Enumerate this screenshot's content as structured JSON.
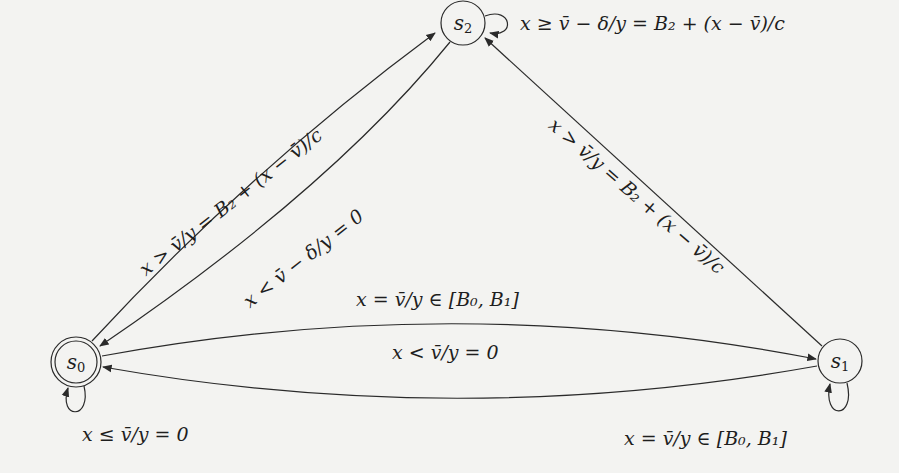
{
  "figure": {
    "type": "state-transition-diagram",
    "states": [
      {
        "id": "s0",
        "label": "s",
        "sub": "0",
        "accepting": true
      },
      {
        "id": "s1",
        "label": "s",
        "sub": "1",
        "accepting": false
      },
      {
        "id": "s2",
        "label": "s",
        "sub": "2",
        "accepting": false
      }
    ],
    "transitions": [
      {
        "from": "s2",
        "to": "s2",
        "label": "x ≥ v̄ − δ/y = B₂ + (x − v̄)/c"
      },
      {
        "from": "s0",
        "to": "s2",
        "label": "x > v̄/y = B₂ + (x − v̄)/c"
      },
      {
        "from": "s2",
        "to": "s0",
        "label": "x < v̄ − δ/y = 0"
      },
      {
        "from": "s1",
        "to": "s2",
        "label": "x > v̄/y = B₂ + (x − v̄)/c"
      },
      {
        "from": "s0",
        "to": "s1",
        "label": "x = v̄/y ∈ [B₀, B₁]"
      },
      {
        "from": "s1",
        "to": "s0",
        "label": "x < v̄/y = 0"
      },
      {
        "from": "s0",
        "to": "s0",
        "label": "x ≤ v̄/y = 0"
      },
      {
        "from": "s1",
        "to": "s1",
        "label": "x = v̄/y ∈ [B₀, B₁]"
      }
    ]
  }
}
